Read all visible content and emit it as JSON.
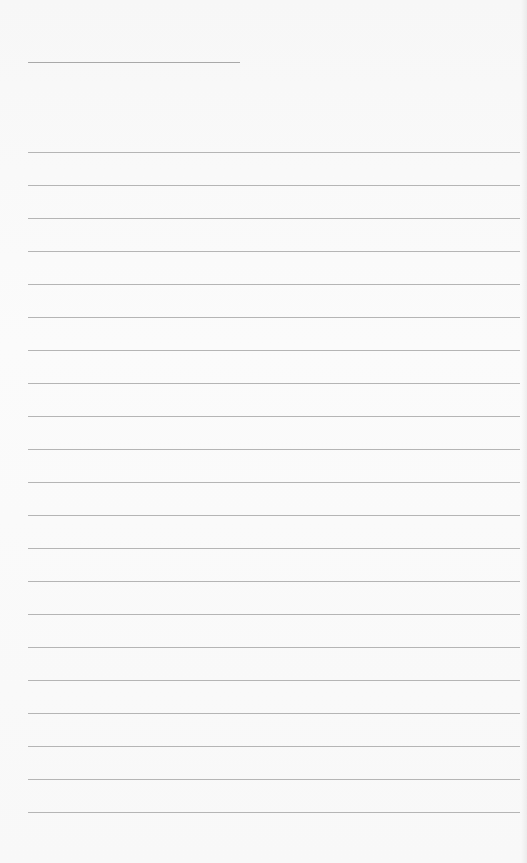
{
  "page": {
    "type": "lined-paper",
    "background_color": "#fafafa",
    "line_color": "#b5b5b5",
    "header_rule": {
      "x1": 28,
      "x2": 240,
      "y": 62
    },
    "ruled_lines": {
      "count": 21,
      "x1": 28,
      "x2": 520,
      "first_y": 152,
      "spacing": 33
    },
    "text": []
  }
}
